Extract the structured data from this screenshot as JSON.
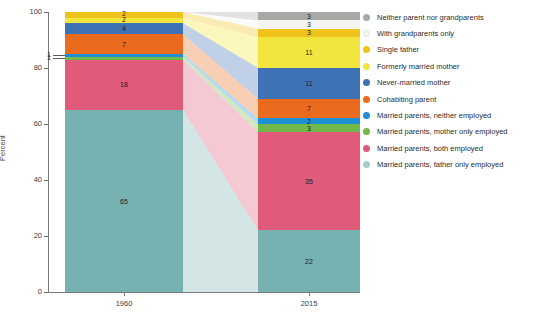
{
  "chart_data": {
    "type": "bar",
    "subtype": "stacked-bar-with-flow-ribbons",
    "title": "",
    "subtitle": "",
    "xlabel": "",
    "ylabel": "Percent",
    "categories": [
      "1960",
      "2015"
    ],
    "ylim": [
      0,
      100
    ],
    "yticks": [
      0,
      20,
      40,
      60,
      80,
      100
    ],
    "grid": false,
    "legend_position": "right",
    "stack_order_bottom_to_top": [
      "Married parents, father only employed",
      "Married parents, both employed",
      "Married parents, mother only employed",
      "Married parents, neither employed",
      "Cohabiting parent",
      "Never-married mother",
      "Formerly married mother",
      "Single father",
      "With grandparents only",
      "Neither parent nor grandparents"
    ],
    "series": [
      {
        "name": "Married parents, father only employed",
        "color": "#78b1b1",
        "values": [
          65,
          22
        ]
      },
      {
        "name": "Married parents, both employed",
        "color": "#e05a79",
        "values": [
          18,
          35
        ]
      },
      {
        "name": "Married parents, mother only employed",
        "color": "#72b84a",
        "values": [
          1,
          3
        ]
      },
      {
        "name": "Married parents, neither employed",
        "color": "#1f8fd4",
        "values": [
          1,
          2
        ]
      },
      {
        "name": "Cohabiting parent",
        "color": "#ea6a1e",
        "values": [
          7,
          7
        ]
      },
      {
        "name": "Never-married mother",
        "color": "#3f72b5",
        "values": [
          4,
          11
        ]
      },
      {
        "name": "Formerly married mother",
        "color": "#f2e63e",
        "values": [
          2,
          11
        ]
      },
      {
        "name": "Single father",
        "color": "#f0c21c",
        "values": [
          2,
          3
        ]
      },
      {
        "name": "With grandparents only",
        "color": "#f4f4f0",
        "values": [
          0,
          3
        ]
      },
      {
        "name": "Neither parent nor grandparents",
        "color": "#a8a8a8",
        "values": [
          0,
          3
        ]
      }
    ],
    "bar_labels": {
      "1960": [
        "65",
        "18",
        "",
        "",
        "7",
        "4",
        "2",
        "2",
        "",
        ""
      ],
      "2015": [
        "22",
        "35",
        "3",
        "2",
        "7",
        "11",
        "11",
        "3",
        "3",
        "3"
      ]
    },
    "callouts": [
      {
        "text": "1",
        "series": "Married parents, neither employed",
        "category": "1960"
      },
      {
        "text": "1",
        "series": "Married parents, mother only employed",
        "category": "1960"
      }
    ]
  },
  "legend": {
    "items": [
      {
        "label": "Neither parent nor grandparents",
        "color": "#a8a8a8"
      },
      {
        "label": "With grandparents only",
        "color": "#f4f4f0"
      },
      {
        "label": "Single father",
        "color": "#f0c21c"
      },
      {
        "label": "Formerly married mother",
        "color": "#f2e63e"
      },
      {
        "label": "Never-married mother",
        "color": "#3f72b5"
      },
      {
        "label": "Cohabiting parent",
        "color": "#ea6a1e"
      },
      {
        "label": "Married parents, neither employed",
        "color": "#1f8fd4"
      },
      {
        "label": "Married parents, mother only employed",
        "color": "#72b84a"
      },
      {
        "label": "Married parents, both employed",
        "color": "#e05a79"
      },
      {
        "label": "Married parents, father only employed",
        "color": "#a7cccc"
      }
    ]
  },
  "axes": {
    "y_label": "Percent",
    "y_ticks": [
      "100",
      "80",
      "60",
      "40",
      "20",
      "0"
    ],
    "x_ticks": [
      "1960",
      "2015"
    ]
  }
}
